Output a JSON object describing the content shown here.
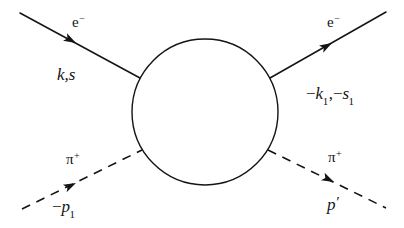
{
  "figure": {
    "background_color": "#ffffff",
    "line_color": "#141414",
    "blob": {
      "name": "interaction-blob",
      "shape": "circle",
      "cx": 205,
      "cy": 112,
      "r": 73,
      "fill": "none",
      "stroke_width": 1.4
    }
  },
  "legs": {
    "electron_in": {
      "particle_label": "e",
      "charge": "−",
      "momentum_text": "k,s",
      "style": "solid",
      "arrow_direction": "toward-blob",
      "x1": 20,
      "y1": 13,
      "x2": 140,
      "y2": 78,
      "arrow_x": 76,
      "arrow_y": 43
    },
    "electron_out": {
      "particle_label": "e",
      "charge": "−",
      "momentum_minus": "−",
      "momentum_sym1": "k",
      "momentum_sub1": "1",
      "momentum_sym2": "s",
      "momentum_sub2": "1",
      "style": "solid",
      "arrow_direction": "away-from-blob",
      "x1": 270,
      "y1": 78,
      "x2": 386,
      "y2": 12,
      "arrow_x": 332,
      "arrow_y": 43
    },
    "pion_in": {
      "particle_label": "π",
      "charge": "+",
      "momentum_minus": "−",
      "momentum_sym": "p",
      "momentum_sub": "1",
      "style": "dashed",
      "arrow_direction": "toward-blob",
      "x1": 22,
      "y1": 209,
      "x2": 142,
      "y2": 150,
      "arrow_x": 76,
      "arrow_y": 183
    },
    "pion_out": {
      "particle_label": "π",
      "charge": "+",
      "momentum_sym": "p",
      "momentum_prime": "′",
      "style": "dashed",
      "arrow_direction": "away-from-blob",
      "x1": 268,
      "y1": 150,
      "x2": 386,
      "y2": 208,
      "arrow_x": 334,
      "arrow_y": 182
    }
  }
}
